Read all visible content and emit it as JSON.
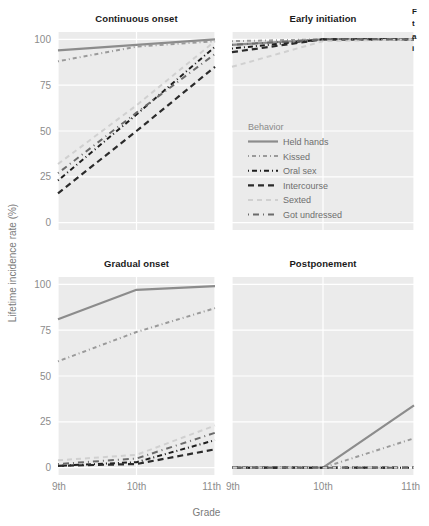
{
  "chart_data": {
    "type": "line",
    "title": "",
    "xlabel": "Grade",
    "ylabel": "Lifetime incidence rate (%)",
    "x": [
      "9th",
      "10th",
      "11th"
    ],
    "xtick_labels": [
      "9th",
      "10th",
      "11th"
    ],
    "ytick_labels": [
      "0",
      "25",
      "50",
      "75",
      "100"
    ],
    "yticks": [
      0,
      25,
      50,
      75,
      100
    ],
    "ylim": [
      -4,
      104
    ],
    "grid": true,
    "legend_title": "Behavior",
    "legend_position": "inside-panel-early-initiation",
    "facet_layout": "2x2",
    "facets": [
      {
        "name": "continuous-onset",
        "title": "Continuous onset",
        "series": [
          {
            "name": "Held hands",
            "values": [
              94,
              97,
              100
            ]
          },
          {
            "name": "Kissed",
            "values": [
              88,
              96,
              99
            ]
          },
          {
            "name": "Oral sex",
            "values": [
              23,
              59,
              96
            ]
          },
          {
            "name": "Intercourse",
            "values": [
              16,
              50,
              85
            ]
          },
          {
            "name": "Sexted",
            "values": [
              32,
              64,
              99
            ]
          },
          {
            "name": "Got undressed",
            "values": [
              27,
              60,
              92
            ]
          }
        ]
      },
      {
        "name": "early-initiation",
        "title": "Early initiation",
        "series": [
          {
            "name": "Held hands",
            "values": [
              97,
              100,
              100
            ]
          },
          {
            "name": "Kissed",
            "values": [
              99,
              100,
              100
            ]
          },
          {
            "name": "Oral sex",
            "values": [
              95,
              100,
              100
            ]
          },
          {
            "name": "Intercourse",
            "values": [
              93,
              100,
              100
            ]
          },
          {
            "name": "Sexted",
            "values": [
              85,
              99,
              100
            ]
          },
          {
            "name": "Got undressed",
            "values": [
              97,
              100,
              100
            ]
          }
        ]
      },
      {
        "name": "gradual-onset",
        "title": "Gradual onset",
        "series": [
          {
            "name": "Held hands",
            "values": [
              81,
              97,
              99
            ]
          },
          {
            "name": "Kissed",
            "values": [
              58,
              74,
              87
            ]
          },
          {
            "name": "Oral sex",
            "values": [
              1,
              3,
              15
            ]
          },
          {
            "name": "Intercourse",
            "values": [
              1,
              2,
              10
            ]
          },
          {
            "name": "Sexted",
            "values": [
              4,
              7,
              23
            ]
          },
          {
            "name": "Got undressed",
            "values": [
              2,
              5,
              19
            ]
          }
        ]
      },
      {
        "name": "postponement",
        "title": "Postponement",
        "series": [
          {
            "name": "Held hands",
            "values": [
              0,
              0,
              34
            ]
          },
          {
            "name": "Kissed",
            "values": [
              0,
              0,
              16
            ]
          },
          {
            "name": "Oral sex",
            "values": [
              0,
              0,
              0
            ]
          },
          {
            "name": "Intercourse",
            "values": [
              0,
              0,
              0
            ]
          },
          {
            "name": "Sexted",
            "values": [
              0,
              0,
              0
            ]
          },
          {
            "name": "Got undressed",
            "values": [
              0,
              0,
              0
            ]
          }
        ]
      }
    ],
    "series_style": [
      {
        "name": "Held hands",
        "color": "#8c8c8c",
        "dash": "none",
        "width": 2.2
      },
      {
        "name": "Kissed",
        "color": "#9a9a9a",
        "dash": "1,3,4,3",
        "width": 2.0
      },
      {
        "name": "Oral sex",
        "color": "#1e1e1e",
        "dash": "1,3,5,3",
        "width": 2.0
      },
      {
        "name": "Intercourse",
        "color": "#2b2b2b",
        "dash": "6,4",
        "width": 2.2
      },
      {
        "name": "Sexted",
        "color": "#d0d0d0",
        "dash": "5,4",
        "width": 2.0
      },
      {
        "name": "Got undressed",
        "color": "#6b6b6b",
        "dash": "1,4,6,4",
        "width": 2.0
      }
    ],
    "panel_background": "#ebebeb",
    "grid_color": "#ffffff"
  },
  "clipped_caption": [
    "F",
    "t",
    "a",
    "i"
  ]
}
